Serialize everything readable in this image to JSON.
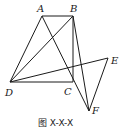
{
  "figure": {
    "caption": "图 X-X-X",
    "points": {
      "A": {
        "label": "A",
        "x": 42,
        "y": 16,
        "lx": 37,
        "ly": 12
      },
      "B": {
        "label": "B",
        "x": 73,
        "y": 16,
        "lx": 70,
        "ly": 12
      },
      "C": {
        "label": "C",
        "x": 73,
        "y": 82,
        "lx": 64,
        "ly": 95
      },
      "D": {
        "label": "D",
        "x": 10,
        "y": 82,
        "lx": 5,
        "ly": 96
      },
      "E": {
        "label": "E",
        "x": 108,
        "y": 58,
        "lx": 111,
        "ly": 64
      },
      "F": {
        "label": "F",
        "x": 89,
        "y": 111,
        "lx": 92,
        "ly": 114
      }
    },
    "segments": [
      [
        "A",
        "B"
      ],
      [
        "A",
        "D"
      ],
      [
        "A",
        "F"
      ],
      [
        "B",
        "D"
      ],
      [
        "B",
        "C"
      ],
      [
        "B",
        "F"
      ],
      [
        "D",
        "C"
      ],
      [
        "D",
        "E"
      ],
      [
        "E",
        "F"
      ]
    ]
  }
}
